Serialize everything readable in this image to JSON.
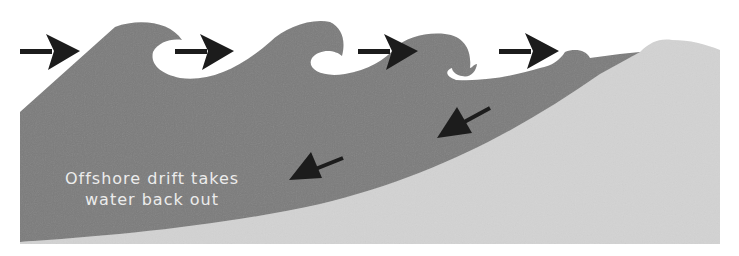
{
  "diagram": {
    "label": {
      "line1": "Offshore drift takes",
      "line2": "water back out"
    },
    "colors": {
      "background": "#ffffff",
      "water": "#7b7b7b",
      "sand": "#d3d3d3",
      "arrow": "#1c1c1c",
      "label_text": "#ececec"
    },
    "incoming_wave_arrows": [
      {
        "name": "incoming-wave-arrow-1",
        "direction": "right"
      },
      {
        "name": "incoming-wave-arrow-2",
        "direction": "right"
      },
      {
        "name": "incoming-wave-arrow-3",
        "direction": "right"
      },
      {
        "name": "incoming-wave-arrow-4",
        "direction": "right"
      }
    ],
    "offshore_drift_arrows": [
      {
        "name": "offshore-drift-arrow-1",
        "direction": "down-left"
      },
      {
        "name": "offshore-drift-arrow-2",
        "direction": "down-left"
      }
    ]
  }
}
